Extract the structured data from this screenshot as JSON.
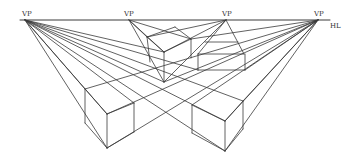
{
  "diagram": {
    "title": "",
    "type": "perspective-drawing",
    "horizon_line": {
      "label": "HL",
      "y": 20,
      "x1": 20,
      "x2": 330
    },
    "vanishing_points": [
      {
        "label": "VP",
        "x": 25,
        "y": 20
      },
      {
        "label": "VP",
        "x": 129,
        "y": 20
      },
      {
        "label": "VP",
        "x": 226,
        "y": 20
      },
      {
        "label": "VP",
        "x": 318,
        "y": 20
      }
    ],
    "objects": [
      {
        "name": "lower-left-box"
      },
      {
        "name": "lower-right-box"
      },
      {
        "name": "floating-box-below-horizon"
      },
      {
        "name": "flat-slab-box"
      }
    ],
    "colors": {
      "line": "#3a3a3a",
      "background": "#ffffff"
    }
  }
}
